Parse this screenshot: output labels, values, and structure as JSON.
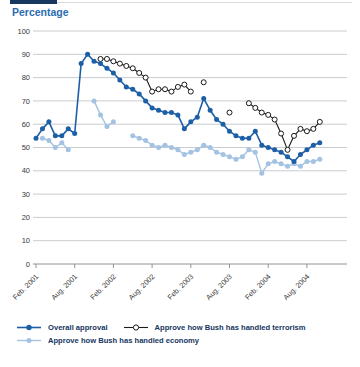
{
  "header": {
    "title": "Percentage"
  },
  "legend": {
    "items": [
      {
        "label": "Overall approval"
      },
      {
        "label": "Approve how Bush has handled terrorism"
      },
      {
        "label": "Approve how Bush has handled economy"
      }
    ]
  },
  "colors": {
    "overall": "#1d5fa7",
    "terrorism": "#1a1a1a",
    "economy": "#a4c2e2",
    "grid": "#c9ccd0",
    "axis": "#8e9499",
    "tick_text": "#3a3a3a",
    "title_blue": "#2a6cb0",
    "top_bar": "#17375e"
  },
  "chart_data": {
    "type": "line",
    "title": "Percentage",
    "xlabel": "",
    "ylabel": "Percentage",
    "grid": true,
    "legend_position": "bottom",
    "x_axis": {
      "unit": "months since Feb 2001",
      "tick_month_offsets": [
        0,
        6,
        12,
        18,
        24,
        30,
        36,
        42
      ],
      "tick_labels": [
        "Feb. 2001",
        "Aug. 2001",
        "Feb. 2002",
        "Aug. 2002",
        "Feb. 2003",
        "Aug. 2003",
        "Feb. 2004",
        "Aug. 2004"
      ]
    },
    "y_axis": {
      "min": 0,
      "max": 100,
      "tick_step": 10,
      "tick_labels": [
        "0",
        "10",
        "20",
        "30",
        "40",
        "50",
        "60",
        "70",
        "80",
        "90",
        "100"
      ]
    },
    "series": [
      {
        "name": "Approve how Bush has handled economy",
        "color": "#a4c2e2",
        "marker": "filled-circle",
        "segments": [
          [
            [
              1,
              54
            ],
            [
              2,
              53
            ],
            [
              3,
              50
            ],
            [
              4,
              52
            ],
            [
              5,
              49
            ]
          ],
          [
            [
              9,
              70
            ],
            [
              10,
              64
            ],
            [
              11,
              59
            ],
            [
              12,
              61
            ]
          ],
          [
            [
              15,
              55
            ],
            [
              16,
              54
            ],
            [
              17,
              53
            ],
            [
              18,
              51
            ],
            [
              19,
              50
            ],
            [
              20,
              51
            ],
            [
              21,
              50
            ],
            [
              22,
              49
            ],
            [
              23,
              47
            ],
            [
              24,
              48
            ],
            [
              25,
              49
            ],
            [
              26,
              51
            ],
            [
              27,
              50
            ],
            [
              28,
              48
            ],
            [
              29,
              47
            ],
            [
              30,
              46
            ],
            [
              31,
              45
            ],
            [
              32,
              46
            ],
            [
              33,
              49
            ],
            [
              34,
              48
            ],
            [
              35,
              39
            ],
            [
              36,
              43
            ],
            [
              37,
              44
            ],
            [
              38,
              43
            ],
            [
              39,
              42
            ],
            [
              40,
              43
            ],
            [
              41,
              42
            ],
            [
              42,
              44
            ],
            [
              43,
              44
            ],
            [
              44,
              45
            ]
          ]
        ]
      },
      {
        "name": "Approve how Bush has handled terrorism",
        "color": "#1a1a1a",
        "marker": "open-circle",
        "segments": [
          [
            [
              10,
              88
            ],
            [
              11,
              88
            ],
            [
              12,
              87
            ],
            [
              13,
              86
            ],
            [
              14,
              85
            ],
            [
              15,
              84
            ],
            [
              16,
              82
            ],
            [
              17,
              80
            ],
            [
              18,
              74
            ],
            [
              19,
              75
            ],
            [
              20,
              75
            ],
            [
              21,
              74
            ],
            [
              22,
              76
            ],
            [
              23,
              77
            ],
            [
              24,
              74
            ]
          ],
          [
            [
              26,
              78
            ]
          ],
          [
            [
              30,
              65
            ]
          ],
          [
            [
              33,
              69
            ],
            [
              34,
              67
            ],
            [
              35,
              65
            ],
            [
              36,
              64
            ],
            [
              37,
              62
            ],
            [
              38,
              56
            ],
            [
              39,
              49
            ],
            [
              40,
              55
            ],
            [
              41,
              58
            ],
            [
              42,
              57
            ],
            [
              43,
              58
            ],
            [
              44,
              61
            ]
          ]
        ]
      },
      {
        "name": "Overall approval",
        "color": "#1d5fa7",
        "marker": "filled-circle",
        "segments": [
          [
            [
              0,
              54
            ],
            [
              1,
              58
            ],
            [
              2,
              61
            ],
            [
              3,
              55
            ],
            [
              4,
              55
            ],
            [
              5,
              58
            ],
            [
              6,
              56
            ],
            [
              7,
              86
            ],
            [
              8,
              90
            ],
            [
              9,
              87
            ],
            [
              10,
              86
            ],
            [
              11,
              84
            ],
            [
              12,
              82
            ],
            [
              13,
              79
            ],
            [
              14,
              76
            ],
            [
              15,
              75
            ],
            [
              16,
              73
            ],
            [
              17,
              70
            ],
            [
              18,
              67
            ],
            [
              19,
              66
            ],
            [
              20,
              65
            ],
            [
              21,
              65
            ],
            [
              22,
              64
            ],
            [
              23,
              58
            ],
            [
              24,
              61
            ],
            [
              25,
              63
            ],
            [
              26,
              71
            ],
            [
              27,
              66
            ],
            [
              28,
              62
            ],
            [
              29,
              60
            ],
            [
              30,
              57
            ],
            [
              31,
              55
            ],
            [
              32,
              54
            ],
            [
              33,
              54
            ],
            [
              34,
              57
            ],
            [
              35,
              51
            ],
            [
              36,
              50
            ],
            [
              37,
              49
            ],
            [
              38,
              48
            ],
            [
              39,
              46
            ],
            [
              40,
              44
            ],
            [
              41,
              47
            ],
            [
              42,
              49
            ],
            [
              43,
              51
            ],
            [
              44,
              52
            ]
          ]
        ]
      }
    ]
  }
}
